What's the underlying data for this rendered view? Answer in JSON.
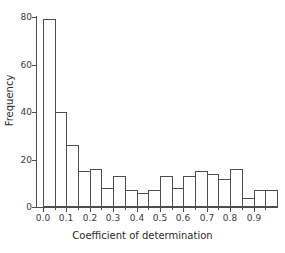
{
  "chart_data": {
    "type": "bar",
    "title": "",
    "xlabel": "Coefficient of determination",
    "ylabel": "Frequency",
    "xlim": [
      -0.025,
      1.0
    ],
    "ylim": [
      0,
      80
    ],
    "grid": false,
    "legend": null,
    "bin_width": 0.05,
    "bin_edges": [
      0.0,
      0.05,
      0.1,
      0.15,
      0.2,
      0.25,
      0.3,
      0.35,
      0.4,
      0.45,
      0.5,
      0.55,
      0.6,
      0.65,
      0.7,
      0.75,
      0.8,
      0.85,
      0.9,
      0.95,
      1.0
    ],
    "categories": [
      "0.00-0.05",
      "0.05-0.10",
      "0.10-0.15",
      "0.15-0.20",
      "0.20-0.25",
      "0.25-0.30",
      "0.30-0.35",
      "0.35-0.40",
      "0.40-0.45",
      "0.45-0.50",
      "0.50-0.55",
      "0.55-0.60",
      "0.60-0.65",
      "0.65-0.70",
      "0.70-0.75",
      "0.75-0.80",
      "0.80-0.85",
      "0.85-0.90",
      "0.90-0.95",
      "0.95-1.00"
    ],
    "values": [
      79,
      40,
      26,
      15,
      16,
      8,
      13,
      7,
      6,
      7,
      13,
      8,
      13,
      15,
      14,
      12,
      16,
      4,
      7,
      7
    ],
    "ytick_labels": [
      "0",
      "20",
      "40",
      "60",
      "80"
    ],
    "ytick_values": [
      0,
      20,
      40,
      60,
      80
    ],
    "xtick_labels": [
      "0.0",
      "0.1",
      "0.2",
      "0.3",
      "0.4",
      "0.5",
      "0.6",
      "0.7",
      "0.8",
      "0.9"
    ],
    "xtick_values": [
      0.0,
      0.1,
      0.2,
      0.3,
      0.4,
      0.5,
      0.6,
      0.7,
      0.8,
      0.9
    ],
    "xtick_minor_values": [
      0.05,
      0.15,
      0.25,
      0.35,
      0.45,
      0.55,
      0.65,
      0.75,
      0.85,
      0.95
    ],
    "bar_fill_color": "#ffffff",
    "bar_edge_color": "#4d4d4d",
    "axis_color": "#4d4d4d",
    "text_color": "#2b2b2b",
    "background_color": "#ffffff"
  }
}
